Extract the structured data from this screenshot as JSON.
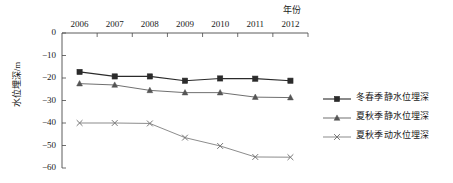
{
  "chart_data": {
    "type": "line",
    "title": "",
    "xlabel": "年份",
    "ylabel": "水位埋深/m",
    "categories": [
      "2006",
      "2007",
      "2008",
      "2009",
      "2010",
      "2011",
      "2012"
    ],
    "xlim": [
      2006,
      2012
    ],
    "ylim": [
      -60,
      0
    ],
    "yticks": [
      "0",
      "-10",
      "-20",
      "-30",
      "-40",
      "-50",
      "-60"
    ],
    "ytick_values": [
      0,
      -10,
      -20,
      -30,
      -40,
      -50,
      -60
    ],
    "grid": false,
    "legend_position": "right",
    "x_axis_position": "top",
    "series": [
      {
        "name": "冬春季静水位埋深",
        "marker": "square",
        "color": "#2b2b2b",
        "values": [
          -17.3,
          -19.3,
          -19.3,
          -21.2,
          -20.2,
          -20.3,
          -21.2
        ]
      },
      {
        "name": "夏秋季静水位埋深",
        "marker": "triangle",
        "color": "#555555",
        "values": [
          -22.5,
          -23.1,
          -25.5,
          -26.5,
          -26.5,
          -28.5,
          -28.7
        ]
      },
      {
        "name": "夏秋季动水位埋深",
        "marker": "cross",
        "color": "#777777",
        "values": [
          -40.0,
          -40.0,
          -40.2,
          -46.5,
          -50.2,
          -55.1,
          -55.2
        ]
      }
    ]
  },
  "axes": {
    "x_title": "年份",
    "y_title": "水位埋深/m"
  },
  "legend": {
    "items": [
      {
        "label": "冬春季静水位埋深"
      },
      {
        "label": "夏秋季静水位埋深"
      },
      {
        "label": "夏秋季动水位埋深"
      }
    ]
  }
}
